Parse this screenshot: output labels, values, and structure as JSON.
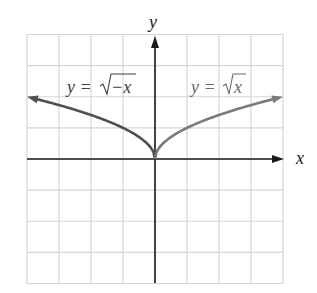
{
  "chart_data": {
    "type": "line",
    "title": "",
    "xlabel": "x",
    "ylabel": "y",
    "xlim": [
      -4,
      4
    ],
    "ylim": [
      -4,
      4
    ],
    "grid": true,
    "series": [
      {
        "name": "y = √−x",
        "label_prefix": "y = ",
        "radicand": "−x",
        "domain": [
          -4,
          0
        ],
        "color": "#505050",
        "x": [
          -4,
          -3,
          -2,
          -1,
          0
        ],
        "values": [
          2,
          1.732,
          1.414,
          1,
          0
        ]
      },
      {
        "name": "y = √x",
        "label_prefix": "y = ",
        "radicand": "x",
        "domain": [
          0,
          4
        ],
        "color": "#7a7a7a",
        "x": [
          0,
          1,
          2,
          3,
          4
        ],
        "values": [
          0,
          1,
          1.414,
          1.732,
          2
        ]
      }
    ]
  },
  "colors": {
    "grid": "#d6d6d6",
    "axis": "#1a1a1a"
  }
}
